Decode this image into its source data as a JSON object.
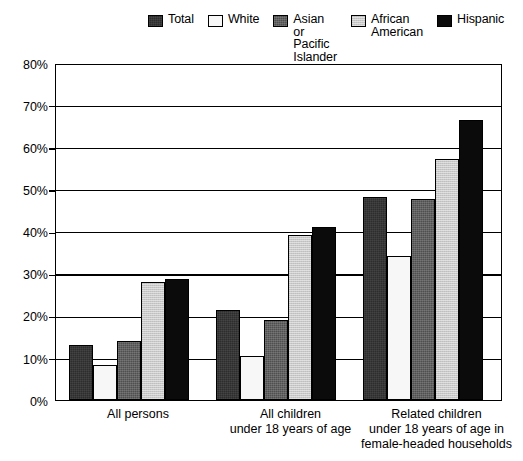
{
  "legend": {
    "items": [
      {
        "label": "Total",
        "color": "#2d2d2d",
        "swatch": "total-swatch"
      },
      {
        "label": "White",
        "color": "#f7f7f7",
        "swatch": "white-swatch"
      },
      {
        "label": "Asian or\nPacific\nIslander",
        "color": "#4f4f4f",
        "swatch": "asian-pacific-islander-swatch"
      },
      {
        "label": "African\nAmerican",
        "color": "#c9c9c9",
        "swatch": "african-american-swatch"
      },
      {
        "label": "Hispanic",
        "color": "#0b0b0b",
        "swatch": "hispanic-swatch"
      }
    ]
  },
  "axis": {
    "y_ticks": [
      "80%",
      "70%",
      "60%",
      "50%",
      "40%",
      "30%",
      "20%",
      "10%",
      "0%"
    ],
    "x_categories": [
      "All persons",
      "All children\nunder 18 years of age",
      "Related children\nunder 18 years of age in\nfemale-headed households"
    ]
  },
  "chart_data": {
    "type": "bar",
    "title": "",
    "subtitle": "",
    "xlabel": "",
    "ylabel": "",
    "ylim": [
      0,
      80
    ],
    "ytick_step": 10,
    "ytick_labels": [
      "0%",
      "10%",
      "20%",
      "30%",
      "40%",
      "50%",
      "60%",
      "70%",
      "80%"
    ],
    "grid": true,
    "legend_position": "top",
    "categories": [
      "All persons",
      "All children under 18 years of age",
      "Related children under 18 years of age in female-headed households"
    ],
    "series": [
      {
        "name": "Total",
        "color": "#2d2d2d",
        "values": [
          13.3,
          21.6,
          48.6
        ]
      },
      {
        "name": "White",
        "color": "#f7f7f7",
        "values": [
          8.5,
          10.6,
          34.4
        ]
      },
      {
        "name": "Asian or Pacific Islander",
        "color": "#4f4f4f",
        "values": [
          14.1,
          19.2,
          48.2
        ]
      },
      {
        "name": "African American",
        "color": "#c9c9c9",
        "values": [
          28.4,
          39.6,
          57.7
        ]
      },
      {
        "name": "Hispanic",
        "color": "#0b0b0b",
        "values": [
          29.0,
          41.4,
          67.0
        ]
      }
    ]
  }
}
